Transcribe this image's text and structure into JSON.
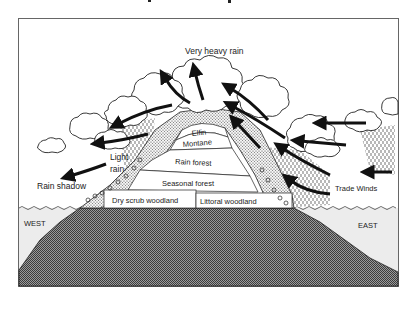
{
  "diagram": {
    "title_partial": "",
    "labels": {
      "very_heavy_rain": "Very heavy rain",
      "elfin": "Elfin",
      "montane": "Montane",
      "rain_forest": "Rain forest",
      "seasonal_forest": "Seasonal forest",
      "dry_scrub_woodland": "Dry scrub woodland",
      "littoral_woodland": "Littoral woodland",
      "light_rain_line1": "Light",
      "light_rain_line2": "rain",
      "rain_shadow": "Rain shadow",
      "trade_winds": "Trade Winds",
      "west": "WEST",
      "east": "EAST"
    },
    "colors": {
      "ink": "#111111",
      "land": "#6e6e6e",
      "sea": "#ebebeb",
      "frame": "#555555"
    }
  }
}
